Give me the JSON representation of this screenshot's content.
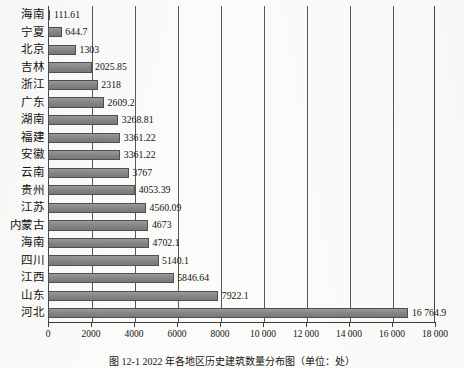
{
  "chart_data": {
    "type": "bar",
    "orientation": "horizontal",
    "title": "",
    "xlabel": "",
    "ylabel": "",
    "xlim": [
      0,
      18000
    ],
    "grid": true,
    "legend": null,
    "bar_color": "#8d8d8d",
    "bar_edge_color": "#4f4f4f",
    "categories": [
      "海南",
      "宁夏",
      "北京",
      "吉林",
      "浙江",
      "广东",
      "湖南",
      "福建",
      "安徽",
      "云南",
      "贵州",
      "江苏",
      "内蒙古",
      "海南",
      "四川",
      "江西",
      "山东",
      "河北"
    ],
    "values": [
      111.61,
      644.7,
      1303,
      2025.85,
      2318,
      2609.2,
      3268.81,
      3361.22,
      3361.22,
      3767,
      4053.39,
      4560.09,
      4673,
      4702.1,
      5140.1,
      5846.64,
      7922.1,
      16764.9
    ],
    "value_labels": [
      "111.61",
      "644.7",
      "1303",
      "2025.85",
      "2318",
      "2609.2",
      "3268.81",
      "3361.22",
      "3361.22",
      "3767",
      "4053.39",
      "4560.09",
      "4673",
      "4702.1",
      "5140.1",
      "5846.64",
      "7922.1",
      "16 764.9"
    ],
    "xticks": [
      0,
      2000,
      4000,
      6000,
      8000,
      10000,
      12000,
      14000,
      16000,
      18000
    ],
    "xtick_labels": [
      "0",
      "2000",
      "4000",
      "6000",
      "8000",
      "10 000",
      "12 000",
      "14 000",
      "16 000",
      "18 000"
    ]
  },
  "caption": "图 12-1  2022 年各地区历史建筑数量分布图（单位：处）"
}
